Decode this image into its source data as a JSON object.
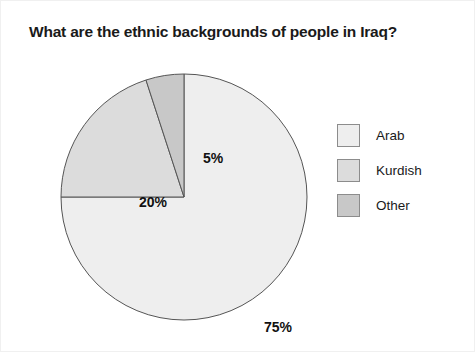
{
  "chart_data": {
    "type": "pie",
    "title": "What are the ethnic backgrounds of people in Iraq?",
    "categories": [
      "Arab",
      "Kurdish",
      "Other"
    ],
    "values": [
      75,
      20,
      5
    ],
    "value_labels": [
      "75%",
      "20%",
      "5%"
    ],
    "unit": "%",
    "total": 100,
    "start_angle_deg": 0,
    "direction": "clockwise",
    "colors": [
      "#eeeeee",
      "#dcdcdc",
      "#c8c8c8"
    ],
    "stroke_color": "#555555",
    "legend_position": "right",
    "grid": false,
    "xlabel": "",
    "ylabel": "",
    "slices": [
      {
        "name": "Arab",
        "value": 75,
        "label": "75%",
        "color": "#eeeeee",
        "start_deg": 0,
        "end_deg": 270
      },
      {
        "name": "Kurdish",
        "value": 20,
        "label": "20%",
        "color": "#dcdcdc",
        "start_deg": 270,
        "end_deg": 342
      },
      {
        "name": "Other",
        "value": 5,
        "label": "5%",
        "color": "#c8c8c8",
        "start_deg": 342,
        "end_deg": 360
      }
    ]
  },
  "legend": {
    "items": [
      {
        "label": "Arab"
      },
      {
        "label": "Kurdish"
      },
      {
        "label": "Other"
      }
    ]
  },
  "background_color": "#ffffff"
}
